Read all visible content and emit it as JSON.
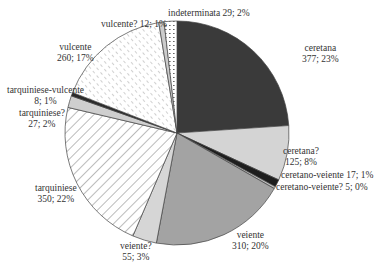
{
  "chart_data": {
    "type": "pie",
    "title": "",
    "start_angle_deg": 0,
    "direction": "clockwise",
    "total": 1575,
    "slices": [
      {
        "label": "ceretana",
        "value": 377,
        "pct": "23%",
        "fill": "#3a3a3a",
        "pattern": "solid"
      },
      {
        "label": "ceretana?",
        "value": 125,
        "pct": "8%",
        "fill": "#d4d4d4",
        "pattern": "solid"
      },
      {
        "label": "ceretano-veiente",
        "value": 17,
        "pct": "1%",
        "fill": "#1e1e1e",
        "pattern": "solid"
      },
      {
        "label": "ceretano-veiente?",
        "value": 5,
        "pct": "0%",
        "fill": "#bdbdbd",
        "pattern": "solid"
      },
      {
        "label": "veiente",
        "value": 310,
        "pct": "20%",
        "fill": "#a3a3a3",
        "pattern": "solid"
      },
      {
        "label": "veiente?",
        "value": 55,
        "pct": "3%",
        "fill": "#d6d6d6",
        "pattern": "solid"
      },
      {
        "label": "tarquiniese",
        "value": 350,
        "pct": "22%",
        "fill": "#ffffff",
        "pattern": "wide-diagonal"
      },
      {
        "label": "tarquiniese?",
        "value": 27,
        "pct": "2%",
        "fill": "#cfcfcf",
        "pattern": "solid"
      },
      {
        "label": "tarquiniese-vulcente",
        "value": 8,
        "pct": "1%",
        "fill": "#2a2a2a",
        "pattern": "solid"
      },
      {
        "label": "vulcente",
        "value": 260,
        "pct": "17%",
        "fill": "#ffffff",
        "pattern": "dashed-diagonal"
      },
      {
        "label": "vulcente?",
        "value": 12,
        "pct": "1%",
        "fill": "#cccccc",
        "pattern": "solid"
      },
      {
        "label": "indeterminata",
        "value": 29,
        "pct": "2%",
        "fill": "#ffffff",
        "pattern": "dots"
      }
    ]
  },
  "labels": {
    "ceretana_name": "ceretana",
    "ceretana_val": "377; 23%",
    "ceretana_q_name": "ceretana?",
    "ceretana_q_val": "125; 8%",
    "ceretano_veiente": "ceretano-veiente 17; 1%",
    "ceretano_veiente_q": "ceretano-veiente? 5; 0%",
    "veiente_name": "veiente",
    "veiente_val": "310; 20%",
    "veiente_q_name": "veiente?",
    "veiente_q_val": "55; 3%",
    "tarquiniese_name": "tarquiniese",
    "tarquiniese_val": "350; 22%",
    "tarquiniese_q_name": "tarquiniese?",
    "tarquiniese_q_val": "27; 2%",
    "tarq_vulc_name": "tarquiniese-vulcente",
    "tarq_vulc_val": "8; 1%",
    "vulcente_name": "vulcente",
    "vulcente_val": "260; 17%",
    "vulcente_q": "vulcente? 12; 1%",
    "indeterminata": "indeterminata 29; 2%"
  }
}
